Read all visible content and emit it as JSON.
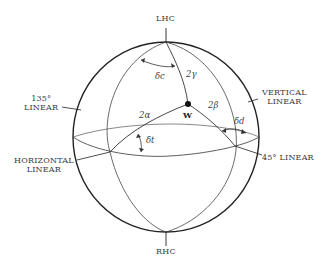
{
  "diagram": {
    "type": "poincare-sphere",
    "labels": {
      "top_pole": "LHC",
      "bottom_pole": "RHC",
      "linear_135_line1": "135°",
      "linear_135_line2": "LINEAR",
      "vertical_line1": "VERTICAL",
      "vertical_line2": "LINEAR",
      "horizontal_line1": "HORIZONTAL",
      "horizontal_line2": "LINEAR",
      "linear_45": "45° LINEAR",
      "point_w": "W"
    },
    "angles": {
      "two_alpha": "2α",
      "two_beta": "2β",
      "two_gamma": "2γ",
      "delta_c": "δc",
      "delta_d": "δd",
      "delta_t": "δt"
    },
    "colors": {
      "line": "#222222",
      "background": "#ffffff"
    }
  }
}
